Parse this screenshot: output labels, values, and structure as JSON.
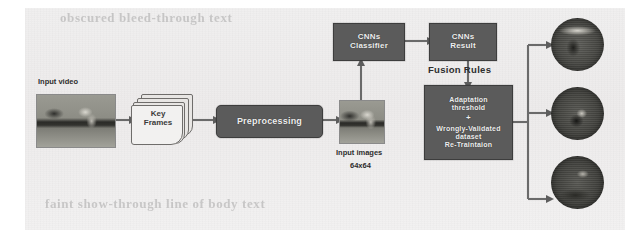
{
  "figure": {
    "background_color": "#efeeee",
    "node_fill_color": "#5b5b5b",
    "node_text_color": "#efefef",
    "connector_color": "#6a6a6a"
  },
  "ghost_text": {
    "top": "obscured bleed-through text",
    "bottom": "faint show-through line of body text"
  },
  "nodes": {
    "input_video": {
      "label": "Input video"
    },
    "key_frames": {
      "line1": "Key",
      "line2": "Frames"
    },
    "preprocessing": {
      "label": "Preprocessing"
    },
    "input_images": {
      "label": "Input images",
      "size": "64x64"
    },
    "cnn_classifier": {
      "line1": "CNNs",
      "line2": "Classifier"
    },
    "cnn_result": {
      "line1": "CNNs",
      "line2": "Result"
    },
    "fusion_rules": {
      "label": "Fusion Rules"
    },
    "adaptation": {
      "line1": "Adaptation",
      "line2": "threshold",
      "separator": "+",
      "line3": "Wrongly-Validated",
      "line4": "dataset",
      "line5": "Re-Traintaion"
    }
  },
  "outputs": {
    "circle_1": "output-result-image-1",
    "circle_2": "output-result-image-2",
    "circle_3": "output-result-image-3"
  }
}
